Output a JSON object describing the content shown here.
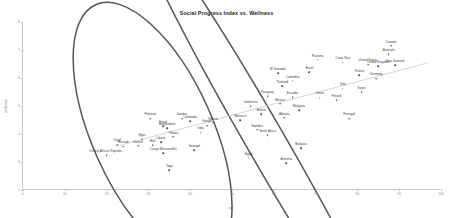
{
  "chart_data": {
    "type": "scatter",
    "title": "Social Progress Index vs. Wellness",
    "xlabel": "spi",
    "ylabel": "wellness",
    "xlim": [
      0,
      100
    ],
    "ylim": [
      2,
      8
    ],
    "grid": false,
    "legend": null,
    "xticks": [
      "0",
      "10",
      "20",
      "30",
      "40",
      "50",
      "60",
      "70",
      "80",
      "90",
      "100"
    ],
    "yticks": [
      "2",
      "3",
      "4",
      "5",
      "6",
      "7",
      "8"
    ],
    "trendline": {
      "x0": 22,
      "y0": 3.55,
      "x1": 97,
      "y1": 6.55,
      "color": "#cfcfcf"
    },
    "annotations": [
      {
        "kind": "ellipse",
        "label": "low-spi-low-wellness-cluster",
        "cx": 31,
        "cy": 4.05,
        "rx": 14.5,
        "ry": 5.0,
        "rotate": -24,
        "color": "#555555"
      },
      {
        "kind": "ellipse",
        "label": "mid-spi-low-wellness-cluster",
        "cx": 58,
        "cy": 3.75,
        "rx": 4.6,
        "ry": 9.5,
        "rotate": -30,
        "color": "#555555"
      }
    ],
    "points": [
      {
        "name": "Central African Republic",
        "x": 20.0,
        "y": 3.25,
        "lx": -1
      },
      {
        "name": "Togo",
        "x": 35.0,
        "y": 2.7,
        "lx": 0
      },
      {
        "name": "Chad",
        "x": 22.5,
        "y": 3.62,
        "lx": 0
      },
      {
        "name": "Burundi",
        "x": 24.0,
        "y": 3.55,
        "lx": 0
      },
      {
        "name": "Guinea",
        "x": 27.5,
        "y": 3.58,
        "lx": 0
      },
      {
        "name": "Niger",
        "x": 28.5,
        "y": 3.8,
        "lx": 0
      },
      {
        "name": "Mali",
        "x": 31.0,
        "y": 3.6,
        "lx": 0
      },
      {
        "name": "Ghana",
        "x": 36.0,
        "y": 3.9,
        "lx": 0
      },
      {
        "name": "Liberia",
        "x": 33.0,
        "y": 3.72,
        "lx": 0
      },
      {
        "name": "Senegal",
        "x": 41.0,
        "y": 3.42,
        "lx": 0
      },
      {
        "name": "Congo (Brazzaville)",
        "x": 33.5,
        "y": 3.32,
        "lx": 0
      },
      {
        "name": "Pakistan",
        "x": 30.5,
        "y": 4.55,
        "lx": 0
      },
      {
        "name": "Nepal",
        "x": 33.5,
        "y": 4.28,
        "lx": 0
      },
      {
        "name": "Bangladesh",
        "x": 34.5,
        "y": 4.2,
        "lx": 0
      },
      {
        "name": "Zambia",
        "x": 38.0,
        "y": 4.55,
        "lx": 0
      },
      {
        "name": "Cambodia",
        "x": 40.0,
        "y": 4.45,
        "lx": 0
      },
      {
        "name": "India",
        "x": 42.5,
        "y": 4.05,
        "lx": 0
      },
      {
        "name": "Kenya",
        "x": 44.0,
        "y": 4.3,
        "lx": 0
      },
      {
        "name": "Nigeria",
        "x": 45.5,
        "y": 4.4,
        "lx": 0
      },
      {
        "name": "Egypt",
        "x": 54.0,
        "y": 3.15,
        "lx": 0
      },
      {
        "name": "Namibia",
        "x": 56.0,
        "y": 4.15,
        "lx": 0
      },
      {
        "name": "South Africa",
        "x": 58.5,
        "y": 3.95,
        "lx": 0
      },
      {
        "name": "Armenia",
        "x": 63.0,
        "y": 2.95,
        "lx": 0
      },
      {
        "name": "Bulgaria",
        "x": 66.5,
        "y": 3.5,
        "lx": 0
      },
      {
        "name": "Morocco",
        "x": 52.0,
        "y": 4.5,
        "lx": 0
      },
      {
        "name": "Indonesia",
        "x": 54.5,
        "y": 5.0,
        "lx": 0
      },
      {
        "name": "Bolivia",
        "x": 57.0,
        "y": 4.72,
        "lx": 0
      },
      {
        "name": "Albania",
        "x": 62.5,
        "y": 4.58,
        "lx": 0
      },
      {
        "name": "Malaysia",
        "x": 66.0,
        "y": 4.85,
        "lx": 0
      },
      {
        "name": "Mexico",
        "x": 61.5,
        "y": 5.08,
        "lx": 0
      },
      {
        "name": "Paraguay",
        "x": 58.5,
        "y": 5.35,
        "lx": 0
      },
      {
        "name": "Ecuador",
        "x": 64.5,
        "y": 5.32,
        "lx": 0
      },
      {
        "name": "Oman",
        "x": 71.0,
        "y": 5.3,
        "lx": 0
      },
      {
        "name": "Poland",
        "x": 75.0,
        "y": 5.2,
        "lx": 0
      },
      {
        "name": "Thailand",
        "x": 62.0,
        "y": 5.7,
        "lx": 0
      },
      {
        "name": "Colombia",
        "x": 64.5,
        "y": 5.9,
        "lx": 0
      },
      {
        "name": "El Salvador",
        "x": 61.0,
        "y": 6.18,
        "lx": 0
      },
      {
        "name": "Brazil",
        "x": 68.5,
        "y": 6.22,
        "lx": 0
      },
      {
        "name": "Italy",
        "x": 76.5,
        "y": 5.62,
        "lx": 0
      },
      {
        "name": "Spain",
        "x": 81.0,
        "y": 5.5,
        "lx": 0
      },
      {
        "name": "Panama",
        "x": 70.5,
        "y": 6.65,
        "lx": 0
      },
      {
        "name": "Costa Rica",
        "x": 76.5,
        "y": 6.55,
        "lx": 0
      },
      {
        "name": "United States",
        "x": 82.5,
        "y": 6.48,
        "lx": 0
      },
      {
        "name": "United Kingdom",
        "x": 85.0,
        "y": 6.42,
        "lx": 0
      },
      {
        "name": "New Zealand",
        "x": 89.0,
        "y": 6.45,
        "lx": 0
      },
      {
        "name": "Australia",
        "x": 87.5,
        "y": 6.85,
        "lx": 0
      },
      {
        "name": "Canada",
        "x": 88.0,
        "y": 7.15,
        "lx": 0
      },
      {
        "name": "France",
        "x": 80.5,
        "y": 6.1,
        "lx": 0
      },
      {
        "name": "Germany",
        "x": 84.5,
        "y": 5.98,
        "lx": 0
      },
      {
        "name": "Portugal",
        "x": 78.0,
        "y": 4.55,
        "lx": 0
      }
    ]
  }
}
